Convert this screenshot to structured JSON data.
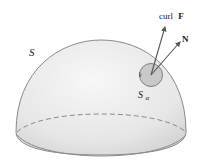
{
  "figure": {
    "labels": {
      "surface": "S",
      "disk_main": "S",
      "disk_sub": "α",
      "curl_word": "curl",
      "curl_vec": "F",
      "normal": "N"
    },
    "colors": {
      "surface_fill_light": "#f4f4f4",
      "surface_fill_dark": "#d9d9d9",
      "outline": "#8a8a8a",
      "disk_fill": "#c8c8c8",
      "arrow": "#555555",
      "text": "#222222"
    }
  }
}
